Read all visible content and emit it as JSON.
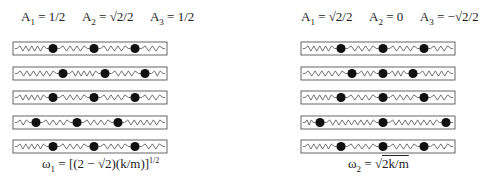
{
  "left_mode": {
    "amplitudes": [
      {
        "label": "A",
        "sub": "1",
        "value": "1/2"
      },
      {
        "label": "A",
        "sub": "2",
        "value": "√2/2"
      },
      {
        "label": "A",
        "sub": "3",
        "value": "1/2"
      }
    ],
    "frequency": {
      "symbol": "ω",
      "sub": "1",
      "eq": "=",
      "expr": "[(2 − √2)(k/m)]",
      "power": "1/2"
    },
    "box_x": [
      13,
      167
    ],
    "rows_mass_x": [
      [
        53,
        94,
        135
      ],
      [
        63,
        105,
        145
      ],
      [
        53,
        94,
        135
      ],
      [
        36,
        77,
        118
      ],
      [
        53,
        94,
        135
      ]
    ]
  },
  "right_mode": {
    "amplitudes": [
      {
        "label": "A",
        "sub": "1",
        "value": "√2/2"
      },
      {
        "label": "A",
        "sub": "2",
        "value": "0"
      },
      {
        "label": "A",
        "sub": "3",
        "value": "−√2/2"
      }
    ],
    "frequency": {
      "symbol": "ω",
      "sub": "2",
      "eq": "=",
      "root": "√",
      "expr": "2k/m"
    },
    "box_x": [
      301,
      455
    ],
    "rows_mass_x": [
      [
        341,
        383,
        424
      ],
      [
        352,
        383,
        413
      ],
      [
        341,
        383,
        424
      ],
      [
        320,
        383,
        446
      ],
      [
        341,
        383,
        424
      ]
    ]
  },
  "layout": {
    "row_y": [
      42,
      67,
      91,
      116,
      140
    ],
    "box_height": 13,
    "mass_radius": 4.6,
    "colors": {
      "line": "#444444",
      "box": "#555555",
      "mass": "#111111"
    }
  }
}
